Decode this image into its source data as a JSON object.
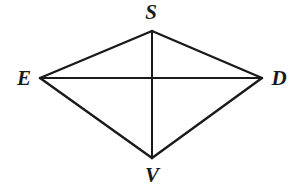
{
  "figure": {
    "type": "geometry-diagram",
    "shape_name": "quadrilateral SDVE with diagonals",
    "background_color": "#ffffff",
    "stroke_color": "#1a1a1a",
    "label_color": "#1a1a1a",
    "canvas": {
      "width": 300,
      "height": 188
    },
    "vertices": [
      {
        "id": "S",
        "label": "S",
        "x": 152,
        "y": 31,
        "label_x": 151,
        "label_y": 12
      },
      {
        "id": "E",
        "label": "E",
        "x": 40,
        "y": 78,
        "label_x": 24,
        "label_y": 78
      },
      {
        "id": "D",
        "label": "D",
        "x": 262,
        "y": 78,
        "label_x": 279,
        "label_y": 78
      },
      {
        "id": "V",
        "label": "V",
        "x": 152,
        "y": 158,
        "label_x": 152,
        "label_y": 175
      }
    ],
    "edges": [
      {
        "id": "edge-ES",
        "from": "E",
        "to": "S",
        "x1": 40,
        "y1": 78,
        "x2": 152,
        "y2": 31,
        "width": 2.4
      },
      {
        "id": "edge-SD",
        "from": "S",
        "to": "D",
        "x1": 152,
        "y1": 31,
        "x2": 262,
        "y2": 78,
        "width": 2.4
      },
      {
        "id": "edge-DV",
        "from": "D",
        "to": "V",
        "x1": 262,
        "y1": 78,
        "x2": 152,
        "y2": 158,
        "width": 2.4
      },
      {
        "id": "edge-VE",
        "from": "V",
        "to": "E",
        "x1": 152,
        "y1": 158,
        "x2": 40,
        "y2": 78,
        "width": 2.4
      }
    ],
    "diagonals": [
      {
        "id": "diagonal-ED",
        "from": "E",
        "to": "D",
        "x1": 40,
        "y1": 78,
        "x2": 262,
        "y2": 78,
        "width": 2.0
      },
      {
        "id": "diagonal-SV",
        "from": "S",
        "to": "V",
        "x1": 152,
        "y1": 31,
        "x2": 152,
        "y2": 158,
        "width": 2.0
      }
    ],
    "intersection": {
      "id": "diagonal-intersection",
      "x": 152,
      "y": 78
    }
  }
}
